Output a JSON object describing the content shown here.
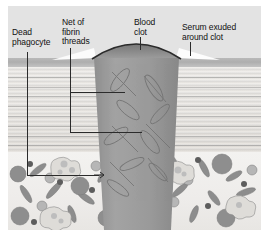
{
  "figure": {
    "type": "anatomical-illustration",
    "background_color": "#e3e3e3",
    "border_color": "#ffffff"
  },
  "labels": [
    {
      "id": "dead-phagocyte",
      "text": "Dead\nphagocyte",
      "x": 12,
      "y": 28,
      "align": "left"
    },
    {
      "id": "fibrin-threads",
      "text": "Net of\nfibrin\nthreads",
      "x": 62,
      "y": 18,
      "align": "left"
    },
    {
      "id": "blood-clot",
      "text": "Blood\nclot",
      "x": 134,
      "y": 18,
      "align": "left"
    },
    {
      "id": "serum-exuded",
      "text": "Serum exuded\naround clot",
      "x": 182,
      "y": 23,
      "align": "left"
    }
  ],
  "leaders": [
    {
      "id": "leader-dead-phagocyte",
      "from_label": "dead-phagocyte",
      "segments": "vertical down from label to subcutaneous layer, then short horizontal arrow right to a phagocyte cell"
    },
    {
      "id": "leader-fibrin-threads",
      "from_label": "fibrin-threads",
      "segments": "vertical down, then two horizontal branches pointing right into the clot interior"
    },
    {
      "id": "leader-blood-clot",
      "from_label": "blood-clot",
      "segments": "short vertical tick down onto the top of the scab"
    },
    {
      "id": "leader-serum-exuded",
      "from_label": "serum-exuded",
      "segments": "short vertical tick down onto the serum wedge beside the clot"
    }
  ],
  "layers": [
    {
      "id": "air",
      "name": "Air above skin surface",
      "color": "#e3e3e3",
      "top": 6,
      "height": 52
    },
    {
      "id": "epidermis",
      "name": "Epidermis (dark band)",
      "color": "#b2b2b2",
      "top": 58,
      "height": 9
    },
    {
      "id": "dermis",
      "name": "Dermis (striated connective tissue)",
      "color": "#e7e4df",
      "top": 67,
      "height": 85
    },
    {
      "id": "subcutis",
      "name": "Subcutaneous tissue with cells",
      "color": "#f1efed",
      "top": 152,
      "height": 78
    }
  ],
  "structures": [
    {
      "id": "scab-cap",
      "name": "Scab cap above skin surface",
      "color": "#8e8e8e",
      "outline": "#2f2f2f"
    },
    {
      "id": "clot-plug",
      "name": "Clot plug filling the wound channel",
      "color": "#9a9a9a"
    },
    {
      "id": "serum-wedge",
      "name": "Serum exuded around clot",
      "color": "#fdfdfd"
    },
    {
      "id": "fibrin-net",
      "name": "Net of fibrin threads inside clot",
      "color": "#7e7e7e"
    }
  ],
  "cells": {
    "name": "Subcutaneous tissue cells",
    "kinds": [
      {
        "id": "erythrocyte-dark",
        "label": "Dark round cell",
        "color": "#8e8e8e"
      },
      {
        "id": "erythrocyte-mid",
        "label": "Mid-grey round cell",
        "color": "#b5b5b5"
      },
      {
        "id": "nucleus-dot",
        "label": "Small dark nucleus",
        "color": "#5d5d5d"
      },
      {
        "id": "fibroblast-rod",
        "label": "Elongated spindle cell",
        "color": "#8b8b8b"
      },
      {
        "id": "phagocyte-amoeboid",
        "label": "Amoeboid phagocyte",
        "color": "#ddddd9"
      }
    ]
  }
}
